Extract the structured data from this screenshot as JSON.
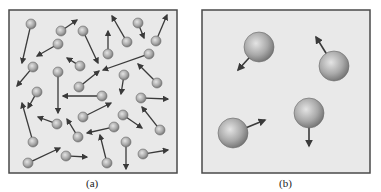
{
  "panels": [
    {
      "id": "a",
      "label": "(a)",
      "description": "Many small gas particles moving randomly in a box",
      "box": {
        "x": 9,
        "y": 10,
        "w": 168,
        "h": 163
      },
      "particle_radius": 5,
      "particles": [
        {
          "x": 31,
          "y": 24,
          "tx": 22,
          "ty": 63
        },
        {
          "x": 61,
          "y": 31,
          "tx": 77,
          "ty": 20
        },
        {
          "x": 83,
          "y": 31,
          "tx": 98,
          "ty": 63
        },
        {
          "x": 127,
          "y": 42,
          "tx": 112,
          "ty": 16
        },
        {
          "x": 138,
          "y": 23,
          "tx": 144,
          "ty": 38
        },
        {
          "x": 156,
          "y": 41,
          "tx": 167,
          "ty": 15
        },
        {
          "x": 58,
          "y": 44,
          "tx": 37,
          "ty": 56
        },
        {
          "x": 108,
          "y": 54,
          "tx": 108,
          "ty": 31
        },
        {
          "x": 80,
          "y": 66,
          "tx": 67,
          "ty": 58
        },
        {
          "x": 149,
          "y": 54,
          "tx": 103,
          "ty": 70
        },
        {
          "x": 33,
          "y": 67,
          "tx": 17,
          "ty": 86
        },
        {
          "x": 58,
          "y": 72,
          "tx": 58,
          "ty": 113
        },
        {
          "x": 79,
          "y": 87,
          "tx": 99,
          "ty": 71
        },
        {
          "x": 124,
          "y": 75,
          "tx": 121,
          "ty": 94
        },
        {
          "x": 157,
          "y": 83,
          "tx": 138,
          "ty": 64
        },
        {
          "x": 37,
          "y": 92,
          "tx": 28,
          "ty": 108
        },
        {
          "x": 102,
          "y": 96,
          "tx": 63,
          "ty": 96
        },
        {
          "x": 141,
          "y": 98,
          "tx": 168,
          "ty": 99
        },
        {
          "x": 83,
          "y": 117,
          "tx": 111,
          "ty": 103
        },
        {
          "x": 123,
          "y": 115,
          "tx": 142,
          "ty": 128
        },
        {
          "x": 57,
          "y": 124,
          "tx": 38,
          "ty": 117
        },
        {
          "x": 33,
          "y": 142,
          "tx": 22,
          "ty": 103
        },
        {
          "x": 78,
          "y": 137,
          "tx": 67,
          "ty": 119
        },
        {
          "x": 114,
          "y": 127,
          "tx": 87,
          "ty": 133
        },
        {
          "x": 160,
          "y": 130,
          "tx": 142,
          "ty": 107
        },
        {
          "x": 126,
          "y": 142,
          "tx": 126,
          "ty": 169
        },
        {
          "x": 107,
          "y": 163,
          "tx": 100,
          "ty": 135
        },
        {
          "x": 28,
          "y": 163,
          "tx": 60,
          "ty": 148
        },
        {
          "x": 66,
          "y": 156,
          "tx": 87,
          "ty": 157
        },
        {
          "x": 143,
          "y": 154,
          "tx": 168,
          "ty": 150
        }
      ]
    },
    {
      "id": "b",
      "label": "(b)",
      "description": "Few large gas particles moving in a box",
      "box": {
        "x": 202,
        "y": 10,
        "w": 168,
        "h": 163
      },
      "particle_radius": 15,
      "particles": [
        {
          "x": 259,
          "y": 47,
          "tx": 238,
          "ty": 70
        },
        {
          "x": 334,
          "y": 66,
          "tx": 316,
          "ty": 37
        },
        {
          "x": 309,
          "y": 113,
          "tx": 309,
          "ty": 146
        },
        {
          "x": 233,
          "y": 133,
          "tx": 265,
          "ty": 120
        }
      ]
    }
  ],
  "colors": {
    "box_fill": "#e9e9e9",
    "box_border": "#4a4a4a",
    "particle_light": "#d8d8d8",
    "particle_dark": "#7a7a7a",
    "arrow": "#3a3a3a"
  }
}
